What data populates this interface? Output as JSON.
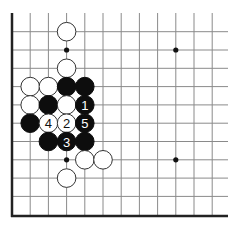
{
  "diagram": {
    "type": "go-board-fragment",
    "colors": {
      "black": "#0d0d0d",
      "white": "#ffffff",
      "grid": "#8a8a8a",
      "edge": "#222222"
    },
    "geometry": {
      "origin_x": 12,
      "top_row_y": 31.7,
      "spacing_x": 18.2,
      "spacing_y": 18.3,
      "cols": 12,
      "rows": 10,
      "grid_top": 13,
      "grid_right": 228,
      "edge_left_x": 12,
      "edge_bottom_y": 216,
      "stone_radius": 9.3
    },
    "edges": [
      "left",
      "bottom"
    ],
    "star_points": [
      {
        "col": 3,
        "row": 1
      },
      {
        "col": 9,
        "row": 1
      },
      {
        "col": 3,
        "row": 7
      },
      {
        "col": 9,
        "row": 7
      }
    ],
    "stones": [
      {
        "color": "white",
        "col": 3,
        "row": 0,
        "label": ""
      },
      {
        "color": "white",
        "col": 3,
        "row": 2,
        "label": ""
      },
      {
        "color": "white",
        "col": 1,
        "row": 3,
        "label": ""
      },
      {
        "color": "white",
        "col": 2,
        "row": 3,
        "label": ""
      },
      {
        "color": "black",
        "col": 3,
        "row": 3,
        "label": ""
      },
      {
        "color": "black",
        "col": 4,
        "row": 3,
        "label": ""
      },
      {
        "color": "white",
        "col": 1,
        "row": 4,
        "label": ""
      },
      {
        "color": "black",
        "col": 2,
        "row": 4,
        "label": ""
      },
      {
        "color": "white",
        "col": 3,
        "row": 4,
        "label": ""
      },
      {
        "color": "black",
        "col": 4,
        "row": 4,
        "label": "1"
      },
      {
        "color": "black",
        "col": 1,
        "row": 5,
        "label": ""
      },
      {
        "color": "white",
        "col": 2,
        "row": 5,
        "label": "4"
      },
      {
        "color": "white",
        "col": 3,
        "row": 5,
        "label": "2"
      },
      {
        "color": "black",
        "col": 4,
        "row": 5,
        "label": "5"
      },
      {
        "color": "black",
        "col": 2,
        "row": 6,
        "label": ""
      },
      {
        "color": "black",
        "col": 3,
        "row": 6,
        "label": "3"
      },
      {
        "color": "black",
        "col": 4,
        "row": 6,
        "label": ""
      },
      {
        "color": "white",
        "col": 4,
        "row": 7,
        "label": ""
      },
      {
        "color": "white",
        "col": 5,
        "row": 7,
        "label": ""
      },
      {
        "color": "white",
        "col": 3,
        "row": 8,
        "label": ""
      }
    ],
    "move_sequence": [
      {
        "move": "1",
        "color": "black"
      },
      {
        "move": "2",
        "color": "white"
      },
      {
        "move": "3",
        "color": "black"
      },
      {
        "move": "4",
        "color": "white"
      },
      {
        "move": "5",
        "color": "black"
      }
    ]
  }
}
